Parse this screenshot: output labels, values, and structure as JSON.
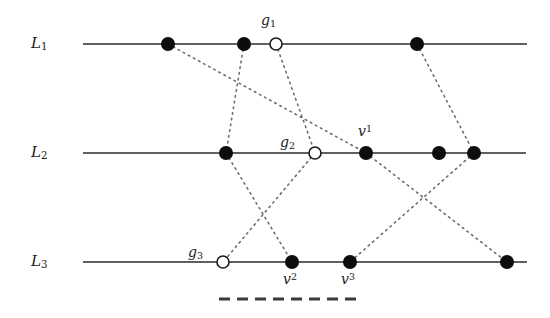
{
  "figure": {
    "type": "diagram",
    "canvas": {
      "width": 550,
      "height": 318
    },
    "colors": {
      "line": "#2b2b2b",
      "node_filled": "#0d0d0d",
      "node_open_stroke": "#1a1a1a",
      "node_open_fill": "#ffffff",
      "connector": "#6e6e6e",
      "dashed_marker": "#3a3a3a",
      "text": "#1a1a1a",
      "background": "#ffffff"
    },
    "lines": [
      {
        "id": "L1",
        "label": "L",
        "sub": "1",
        "label_x": 31,
        "label_y": 36,
        "y": 44,
        "x_start": 83,
        "x_end": 527
      },
      {
        "id": "L2",
        "label": "L",
        "sub": "2",
        "label_x": 31,
        "label_y": 145,
        "y": 153,
        "x_start": 83,
        "x_end": 526
      },
      {
        "id": "L3",
        "label": "L",
        "sub": "3",
        "label_x": 31,
        "label_y": 254,
        "y": 262,
        "x_start": 83,
        "x_end": 527
      }
    ],
    "nodes": [
      {
        "id": "n1a",
        "line": "L1",
        "x": 168,
        "y": 44,
        "style": "filled",
        "r": 7
      },
      {
        "id": "n1b",
        "line": "L1",
        "x": 244,
        "y": 44,
        "style": "filled",
        "r": 7
      },
      {
        "id": "g1",
        "line": "L1",
        "x": 276,
        "y": 44,
        "style": "open",
        "r": 6
      },
      {
        "id": "n1c",
        "line": "L1",
        "x": 417,
        "y": 44,
        "style": "filled",
        "r": 7
      },
      {
        "id": "n2a",
        "line": "L2",
        "x": 226,
        "y": 153,
        "style": "filled",
        "r": 7
      },
      {
        "id": "g2",
        "line": "L2",
        "x": 315,
        "y": 153,
        "style": "open",
        "r": 6
      },
      {
        "id": "v1",
        "line": "L2",
        "x": 366,
        "y": 153,
        "style": "filled",
        "r": 7
      },
      {
        "id": "n2b",
        "line": "L2",
        "x": 439,
        "y": 153,
        "style": "filled",
        "r": 7
      },
      {
        "id": "n2c",
        "line": "L2",
        "x": 474,
        "y": 153,
        "style": "filled",
        "r": 7
      },
      {
        "id": "g3",
        "line": "L3",
        "x": 223,
        "y": 262,
        "style": "open",
        "r": 6
      },
      {
        "id": "v2",
        "line": "L3",
        "x": 292,
        "y": 262,
        "style": "filled",
        "r": 7
      },
      {
        "id": "v3",
        "line": "L3",
        "x": 350,
        "y": 262,
        "style": "filled",
        "r": 7
      },
      {
        "id": "n3c",
        "line": "L3",
        "x": 507,
        "y": 262,
        "style": "filled",
        "r": 7
      }
    ],
    "connectors": [
      {
        "from": "n1a",
        "to": "v1",
        "x1": 168,
        "y1": 44,
        "x2": 366,
        "y2": 153
      },
      {
        "from": "n1b",
        "to": "n2a",
        "x1": 244,
        "y1": 44,
        "x2": 226,
        "y2": 153
      },
      {
        "from": "g1",
        "to": "g2",
        "x1": 276,
        "y1": 44,
        "x2": 315,
        "y2": 153
      },
      {
        "from": "n1c",
        "to": "n2c",
        "x1": 417,
        "y1": 44,
        "x2": 474,
        "y2": 153
      },
      {
        "from": "n2a",
        "to": "v2",
        "x1": 226,
        "y1": 153,
        "x2": 292,
        "y2": 262
      },
      {
        "from": "g2",
        "to": "g3",
        "x1": 315,
        "y1": 153,
        "x2": 223,
        "y2": 262
      },
      {
        "from": "v1",
        "to": "n3c",
        "x1": 366,
        "y1": 153,
        "x2": 507,
        "y2": 262
      },
      {
        "from": "n2c",
        "to": "v3",
        "x1": 474,
        "y1": 153,
        "x2": 350,
        "y2": 262
      }
    ],
    "node_labels": [
      {
        "id": "g1-label",
        "base": "g",
        "sub": "1",
        "sup": "",
        "x": 261,
        "y": 13
      },
      {
        "id": "g2-label",
        "base": "g",
        "sub": "2",
        "sup": "",
        "x": 280,
        "y": 135
      },
      {
        "id": "g3-label",
        "base": "g",
        "sub": "3",
        "sup": "",
        "x": 188,
        "y": 245
      },
      {
        "id": "v1-label",
        "base": "v",
        "sub": "",
        "sup": "1",
        "x": 358,
        "y": 124
      },
      {
        "id": "v2-label",
        "base": "v",
        "sub": "",
        "sup": "2",
        "x": 283,
        "y": 272
      },
      {
        "id": "v3-label",
        "base": "v",
        "sub": "",
        "sup": "3",
        "x": 341,
        "y": 272
      }
    ],
    "dashed_marker": {
      "id": "bottom-dashed-segment",
      "x_start": 219,
      "x_end": 357,
      "y": 299,
      "dash_length": 11,
      "gap_length": 7,
      "stroke_width": 3
    }
  }
}
